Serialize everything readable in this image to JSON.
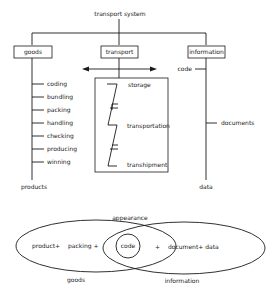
{
  "diagram": {
    "title": "transport system",
    "top_boxes": {
      "goods": "goods",
      "transport": "transport",
      "information": "information"
    },
    "goods_branch": {
      "items": [
        "coding",
        "bundling",
        "packing",
        "handling",
        "checking",
        "producing",
        "winning"
      ],
      "result": "products"
    },
    "transport_branch": {
      "stages": [
        "storage",
        "transportation",
        "transhipment"
      ]
    },
    "information_branch": {
      "items": [
        "code",
        "documents"
      ],
      "result": "data"
    },
    "venn": {
      "title": "appearance",
      "left_label": "goods",
      "right_label": "information",
      "left_text_1": "product+",
      "left_text_2": "packing +",
      "center_text": "code",
      "right_plus": "+",
      "right_text": "document+ data"
    },
    "colors": {
      "ink": "#1a1a1a",
      "background": "#ffffff"
    }
  }
}
